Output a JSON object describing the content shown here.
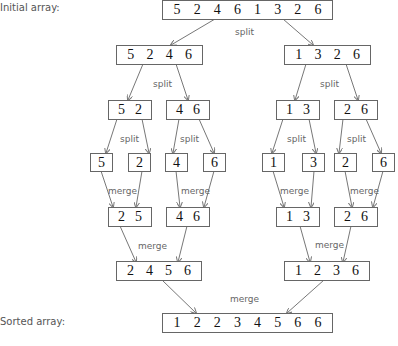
{
  "labels": {
    "initial": "Initial array:",
    "sorted": "Sorted array:"
  },
  "operations": {
    "split": "split",
    "merge": "merge"
  },
  "boxes": {
    "top": [
      "5",
      "2",
      "4",
      "6",
      "1",
      "3",
      "2",
      "6"
    ],
    "split1_left": [
      "5",
      "2",
      "4",
      "6"
    ],
    "split1_right": [
      "1",
      "3",
      "2",
      "6"
    ],
    "split2_a": [
      "5",
      "2"
    ],
    "split2_b": [
      "4",
      "6"
    ],
    "split2_c": [
      "1",
      "3"
    ],
    "split2_d": [
      "2",
      "6"
    ],
    "single": [
      "5",
      "2",
      "4",
      "6",
      "1",
      "3",
      "2",
      "6"
    ],
    "merge1_a": [
      "2",
      "5"
    ],
    "merge1_b": [
      "4",
      "6"
    ],
    "merge1_c": [
      "1",
      "3"
    ],
    "merge1_d": [
      "2",
      "6"
    ],
    "merge2_left": [
      "2",
      "4",
      "5",
      "6"
    ],
    "merge2_right": [
      "1",
      "2",
      "3",
      "6"
    ],
    "final": [
      "1",
      "2",
      "2",
      "3",
      "4",
      "5",
      "6",
      "6"
    ]
  },
  "colors": {
    "border": "#666666",
    "arrow": "#777777",
    "text": "#111111",
    "label": "#555555"
  }
}
